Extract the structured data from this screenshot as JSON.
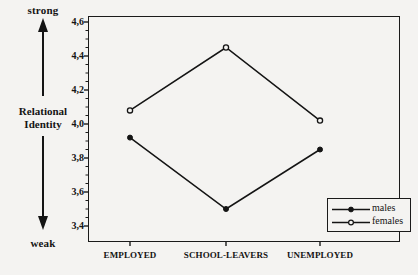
{
  "axis_annotation": {
    "top_label": "strong",
    "bottom_label": "weak",
    "title_line1": "Relational",
    "title_line2": "Identity"
  },
  "legend": {
    "males_label": "males",
    "females_label": "females"
  },
  "chart_data": {
    "type": "line",
    "title": "",
    "xlabel": "",
    "ylabel": "Relational Identity",
    "categories": [
      "EMPLOYED",
      "SCHOOL-LEAVERS",
      "UNEMPLOYED"
    ],
    "series": [
      {
        "name": "males",
        "values": [
          3.92,
          3.5,
          3.85
        ],
        "marker": "filled-circle"
      },
      {
        "name": "females",
        "values": [
          4.08,
          4.45,
          4.02
        ],
        "marker": "open-circle"
      }
    ],
    "ylim": [
      3.4,
      4.6
    ],
    "ytick_labels": [
      "4,6",
      "4,4",
      "4,2",
      "4,0",
      "3,8",
      "3,6",
      "3,4"
    ],
    "ytick_values": [
      4.6,
      4.4,
      4.2,
      4.0,
      3.8,
      3.6,
      3.4
    ],
    "yminor_step": 0.05,
    "grid": false,
    "legend_position": "bottom-right",
    "decimal_separator": ",",
    "line_color": "#141414",
    "frame_color": "#1a1a1a"
  }
}
